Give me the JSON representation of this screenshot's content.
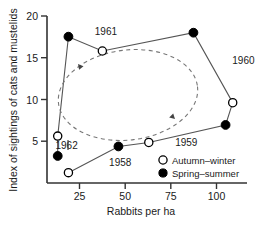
{
  "chart_data": {
    "type": "scatter",
    "title": "",
    "xlabel": "Rabbits per ha",
    "ylabel": "Index of sightings of cats and mustelids",
    "xlim": [
      0,
      112
    ],
    "ylim": [
      0,
      21
    ],
    "xticks": [
      25,
      50,
      75,
      100
    ],
    "yticks": [
      5,
      10,
      15,
      20
    ],
    "grid": false,
    "legend_position": "bottom-right",
    "legend": [
      {
        "key": "autumn-winter",
        "label": "Autumn–winter",
        "marker": "open-circle"
      },
      {
        "key": "spring-summer",
        "label": "Spring–summer",
        "marker": "filled-circle"
      }
    ],
    "series": [
      {
        "name": "Autumn–winter",
        "marker": "open-circle",
        "points": [
          {
            "x": 12,
            "y": 1.3
          },
          {
            "x": 6,
            "y": 5.9
          },
          {
            "x": 57,
            "y": 5.1
          },
          {
            "x": 104,
            "y": 10.1
          },
          {
            "x": 31,
            "y": 16.6
          }
        ]
      },
      {
        "name": "Spring–summer",
        "marker": "filled-circle",
        "points": [
          {
            "x": 6,
            "y": 3.4
          },
          {
            "x": 40,
            "y": 4.6
          },
          {
            "x": 100,
            "y": 7.3
          },
          {
            "x": 82,
            "y": 18.9
          },
          {
            "x": 12,
            "y": 18.4
          }
        ]
      }
    ],
    "path_order": [
      {
        "x": 12,
        "y": 1.3
      },
      {
        "x": 40,
        "y": 4.6
      },
      {
        "x": 57,
        "y": 5.1
      },
      {
        "x": 100,
        "y": 7.3
      },
      {
        "x": 104,
        "y": 10.1
      },
      {
        "x": 82,
        "y": 18.9
      },
      {
        "x": 31,
        "y": 16.6
      },
      {
        "x": 12,
        "y": 18.4
      },
      {
        "x": 6,
        "y": 5.9
      },
      {
        "x": 6,
        "y": 3.4
      }
    ],
    "annotations": [
      {
        "text": "1961",
        "x": 33,
        "y": 18.6
      },
      {
        "text": "1960",
        "x": 110,
        "y": 15.0
      },
      {
        "text": "1959",
        "x": 78,
        "y": 4.6
      },
      {
        "text": "1958",
        "x": 41,
        "y": 2.1
      },
      {
        "text": "1962",
        "x": 11,
        "y": 4.3
      }
    ],
    "cycle_indicator": {
      "shape": "dashed-ellipse",
      "direction": "counterclockwise",
      "arrow_count": 2
    }
  },
  "colors": {
    "axis": "#333333",
    "marker_fill": "#000000",
    "marker_edge": "#000000",
    "marker_open_fill": "#ffffff",
    "line": "#555555",
    "dashed": "#777777",
    "text": "#1a1a1a",
    "background": "#ffffff"
  }
}
